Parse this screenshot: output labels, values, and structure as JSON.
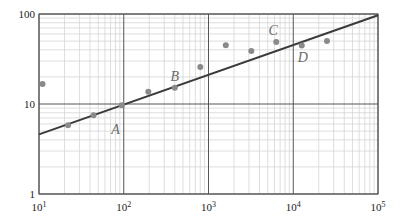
{
  "chart_data": {
    "type": "scatter",
    "title": "",
    "xlabel": "",
    "ylabel": "",
    "xscale": "log",
    "yscale": "log",
    "xlim": [
      10,
      100000
    ],
    "ylim": [
      1,
      100
    ],
    "grid": true,
    "legend": null,
    "x_ticks": [
      {
        "value": 10,
        "base": "10",
        "exp": "1"
      },
      {
        "value": 100,
        "base": "10",
        "exp": "2"
      },
      {
        "value": 1000,
        "base": "10",
        "exp": "3"
      },
      {
        "value": 10000,
        "base": "10",
        "exp": "4"
      },
      {
        "value": 100000,
        "base": "10",
        "exp": "5"
      }
    ],
    "y_ticks": [
      {
        "value": 1,
        "label": "1"
      },
      {
        "value": 10,
        "label": "10"
      },
      {
        "value": 100,
        "label": "100"
      }
    ],
    "series": [
      {
        "name": "data points",
        "kind": "scatter",
        "x": [
          11,
          22,
          44,
          95,
          195,
          400,
          800,
          1600,
          3200,
          6300,
          12600,
          25000
        ],
        "y": [
          16.7,
          5.8,
          7.5,
          9.7,
          13.7,
          15.2,
          25.8,
          45,
          38.9,
          49,
          44.7,
          50
        ]
      },
      {
        "name": "fit line",
        "kind": "line",
        "x": [
          10,
          100000
        ],
        "y": [
          4.6,
          97
        ]
      }
    ],
    "annotations": [
      {
        "text": "A",
        "x": 80,
        "y": 5.3
      },
      {
        "text": "B",
        "x": 400,
        "y": 20.5
      },
      {
        "text": "C",
        "x": 5800,
        "y": 66
      },
      {
        "text": "D",
        "x": 13000,
        "y": 33
      }
    ]
  },
  "colors": {
    "axis": "#555555",
    "major_grid": "#555555",
    "minor_grid": "#d6d6d6",
    "points": "#8a8a8a",
    "fit_line": "#3a3a3a",
    "labels": "#6a6a6a"
  }
}
